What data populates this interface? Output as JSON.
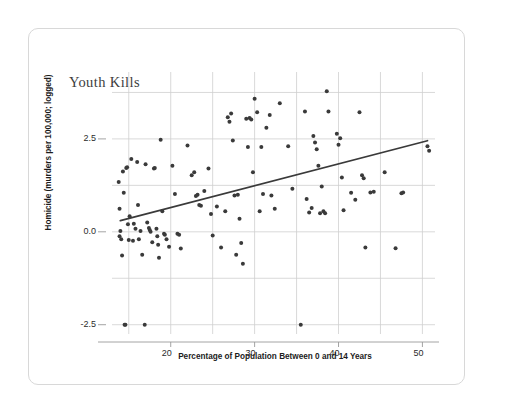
{
  "card": {
    "title": "Youth Kills"
  },
  "chart_data": {
    "type": "scatter",
    "title": "Youth Kills",
    "xlabel": "Percentage of Population Between 0 and 14 Years",
    "ylabel": "Homicide (murders per 100,000; logged)",
    "xlim": [
      13.0,
      51.5
    ],
    "ylim": [
      -2.75,
      4.3
    ],
    "xticks": [
      20,
      30,
      40,
      50
    ],
    "xtick_labels": [
      "20",
      "30",
      "40",
      "50"
    ],
    "yticks": [
      2.5,
      0.0,
      -2.5
    ],
    "ytick_labels": [
      "2.5",
      "0.0",
      "-2.5"
    ],
    "grid": true,
    "grid_x": [
      15,
      20,
      25,
      30,
      35,
      40,
      45,
      50
    ],
    "grid_y": [
      -2.5,
      -1.25,
      0.0,
      1.25,
      2.5,
      3.75
    ],
    "legend": null,
    "point_color": "#3a3a3a",
    "point_size": 4,
    "grid_color": "#cfcfcf",
    "trendline": {
      "label": "linear fit",
      "color": "#3a3a3a",
      "x0": 14.0,
      "y0": 0.3,
      "x1": 50.6,
      "y1": 2.45
    },
    "points": [
      [
        13.8,
        1.34
      ],
      [
        13.9,
        0.62
      ],
      [
        13.9,
        -0.12
      ],
      [
        14.0,
        0.02
      ],
      [
        14.1,
        -0.2
      ],
      [
        14.2,
        -0.64
      ],
      [
        14.3,
        1.62
      ],
      [
        14.4,
        1.05
      ],
      [
        14.5,
        -2.5
      ],
      [
        14.6,
        -2.5
      ],
      [
        14.7,
        1.72
      ],
      [
        14.8,
        1.74
      ],
      [
        14.9,
        0.2
      ],
      [
        15.0,
        -0.22
      ],
      [
        15.1,
        0.42
      ],
      [
        15.3,
        1.96
      ],
      [
        15.5,
        -0.24
      ],
      [
        15.6,
        0.22
      ],
      [
        15.8,
        0.08
      ],
      [
        16.0,
        1.88
      ],
      [
        16.1,
        0.72
      ],
      [
        16.2,
        -0.2
      ],
      [
        16.4,
        0.02
      ],
      [
        16.6,
        -0.62
      ],
      [
        16.9,
        -2.5
      ],
      [
        17.0,
        1.82
      ],
      [
        17.2,
        0.25
      ],
      [
        17.4,
        0.1
      ],
      [
        17.5,
        0.05
      ],
      [
        17.6,
        0.0
      ],
      [
        17.8,
        -0.28
      ],
      [
        18.0,
        1.7
      ],
      [
        18.1,
        1.72
      ],
      [
        18.3,
        0.08
      ],
      [
        18.4,
        -0.12
      ],
      [
        18.5,
        -0.35
      ],
      [
        18.6,
        -0.7
      ],
      [
        18.8,
        2.48
      ],
      [
        19.0,
        0.55
      ],
      [
        19.2,
        -0.05
      ],
      [
        19.3,
        -0.08
      ],
      [
        19.5,
        -0.2
      ],
      [
        19.8,
        -0.4
      ],
      [
        20.2,
        1.78
      ],
      [
        20.5,
        1.02
      ],
      [
        20.8,
        -0.05
      ],
      [
        21.0,
        -0.08
      ],
      [
        21.2,
        -0.45
      ],
      [
        22.0,
        2.32
      ],
      [
        22.5,
        1.52
      ],
      [
        22.8,
        1.6
      ],
      [
        23.0,
        0.96
      ],
      [
        23.2,
        1.0
      ],
      [
        23.4,
        0.72
      ],
      [
        23.6,
        0.7
      ],
      [
        24.0,
        1.1
      ],
      [
        24.5,
        1.7
      ],
      [
        24.8,
        0.48
      ],
      [
        25.0,
        -0.1
      ],
      [
        25.5,
        0.68
      ],
      [
        26.0,
        -0.42
      ],
      [
        26.5,
        0.55
      ],
      [
        26.8,
        3.08
      ],
      [
        27.0,
        2.96
      ],
      [
        27.2,
        3.18
      ],
      [
        27.4,
        2.46
      ],
      [
        27.6,
        0.98
      ],
      [
        27.8,
        -0.62
      ],
      [
        28.0,
        1.0
      ],
      [
        28.2,
        0.35
      ],
      [
        28.4,
        -0.3
      ],
      [
        28.6,
        -0.86
      ],
      [
        29.0,
        3.04
      ],
      [
        29.2,
        2.28
      ],
      [
        29.4,
        3.06
      ],
      [
        29.6,
        3.02
      ],
      [
        29.8,
        1.6
      ],
      [
        30.0,
        3.58
      ],
      [
        30.3,
        3.22
      ],
      [
        30.6,
        0.55
      ],
      [
        30.8,
        2.28
      ],
      [
        31.0,
        1.02
      ],
      [
        31.4,
        2.8
      ],
      [
        31.8,
        3.14
      ],
      [
        32.0,
        0.98
      ],
      [
        32.4,
        0.62
      ],
      [
        33.0,
        3.46
      ],
      [
        34.0,
        2.3
      ],
      [
        34.5,
        1.16
      ],
      [
        35.5,
        -2.5
      ],
      [
        36.0,
        3.24
      ],
      [
        36.2,
        0.88
      ],
      [
        36.5,
        0.52
      ],
      [
        36.8,
        0.64
      ],
      [
        37.0,
        2.58
      ],
      [
        37.2,
        2.4
      ],
      [
        37.4,
        2.22
      ],
      [
        37.6,
        1.78
      ],
      [
        37.8,
        0.5
      ],
      [
        38.0,
        1.22
      ],
      [
        38.2,
        0.55
      ],
      [
        38.4,
        0.5
      ],
      [
        38.6,
        3.78
      ],
      [
        38.8,
        3.24
      ],
      [
        39.8,
        2.64
      ],
      [
        40.0,
        2.34
      ],
      [
        40.2,
        2.52
      ],
      [
        40.4,
        1.46
      ],
      [
        40.6,
        0.58
      ],
      [
        41.5,
        1.05
      ],
      [
        42.0,
        0.86
      ],
      [
        42.5,
        3.22
      ],
      [
        42.8,
        1.52
      ],
      [
        43.0,
        1.44
      ],
      [
        43.2,
        -0.42
      ],
      [
        43.8,
        1.06
      ],
      [
        44.2,
        1.08
      ],
      [
        45.5,
        1.6
      ],
      [
        46.8,
        -0.44
      ],
      [
        47.5,
        1.04
      ],
      [
        47.7,
        1.06
      ],
      [
        50.6,
        2.3
      ],
      [
        50.8,
        2.18
      ]
    ]
  }
}
